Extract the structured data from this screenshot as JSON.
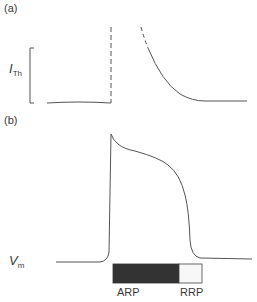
{
  "panel_a": {
    "label": "(a)",
    "ylabel_main": "I",
    "ylabel_sub": "Th",
    "description": "Threshold current vs time: near-baseline before, infinite (dashed) during absolute refractory period, decaying curve during relative refractory period"
  },
  "panel_b": {
    "label": "(b)",
    "ylabel_main": "V",
    "ylabel_sub": "m",
    "description": "Cardiac action potential waveform"
  },
  "bars": {
    "arp_label": "ARP",
    "rrp_label": "RRP",
    "arp_color": "#333333",
    "rrp_color": "#f7f7f7"
  },
  "colors": {
    "line": "#555555",
    "text": "#3a3a3a"
  }
}
